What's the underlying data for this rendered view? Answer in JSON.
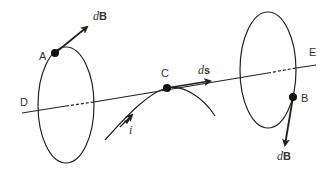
{
  "colors": {
    "ink": "#222222",
    "label": "#333333",
    "background": "#ffffff"
  },
  "labels": {
    "point_a": "A",
    "point_b": "B",
    "point_c": "C",
    "point_d": "D",
    "point_e": "E",
    "current": "i",
    "dB_a_prefix": "d",
    "dB_a_vec": "B",
    "dB_b_prefix": "d",
    "dB_b_vec": "B",
    "ds_prefix": "d",
    "ds_vec": "s"
  }
}
